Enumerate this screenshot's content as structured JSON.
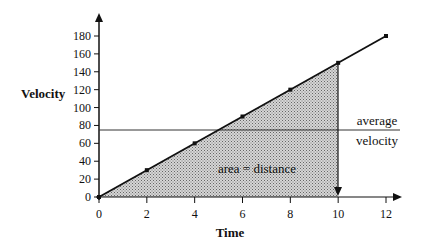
{
  "chart_data": {
    "type": "line",
    "title": "",
    "xlabel": "Time",
    "ylabel": "Velocity",
    "x": [
      0,
      2,
      4,
      6,
      8,
      10,
      12
    ],
    "series": [
      {
        "name": "velocity",
        "values": [
          0,
          30,
          60,
          90,
          120,
          150,
          180
        ]
      }
    ],
    "average_velocity": 75,
    "xticks": [
      "0",
      "2",
      "4",
      "6",
      "8",
      "10",
      "12"
    ],
    "yticks": [
      "0",
      "20",
      "40",
      "60",
      "80",
      "100",
      "120",
      "140",
      "160",
      "180"
    ],
    "xlim": [
      0,
      13
    ],
    "ylim": [
      0,
      200
    ],
    "grid": false,
    "legend": "none",
    "annotations": [
      "area = distance",
      "average",
      "velocity"
    ],
    "shaded_region": {
      "x_from": 0,
      "x_to": 10,
      "label": "area = distance"
    }
  },
  "labels": {
    "xlabel": "Time",
    "ylabel": "Velocity",
    "area": "area = distance",
    "avg1": "average",
    "avg2": "velocity"
  },
  "xticks": [
    "0",
    "2",
    "4",
    "6",
    "8",
    "10",
    "12"
  ],
  "yticks": [
    "0",
    "20",
    "40",
    "60",
    "80",
    "100",
    "120",
    "140",
    "160",
    "180"
  ],
  "colors": {
    "line": "#111111",
    "fill": "#b8b8b8"
  }
}
